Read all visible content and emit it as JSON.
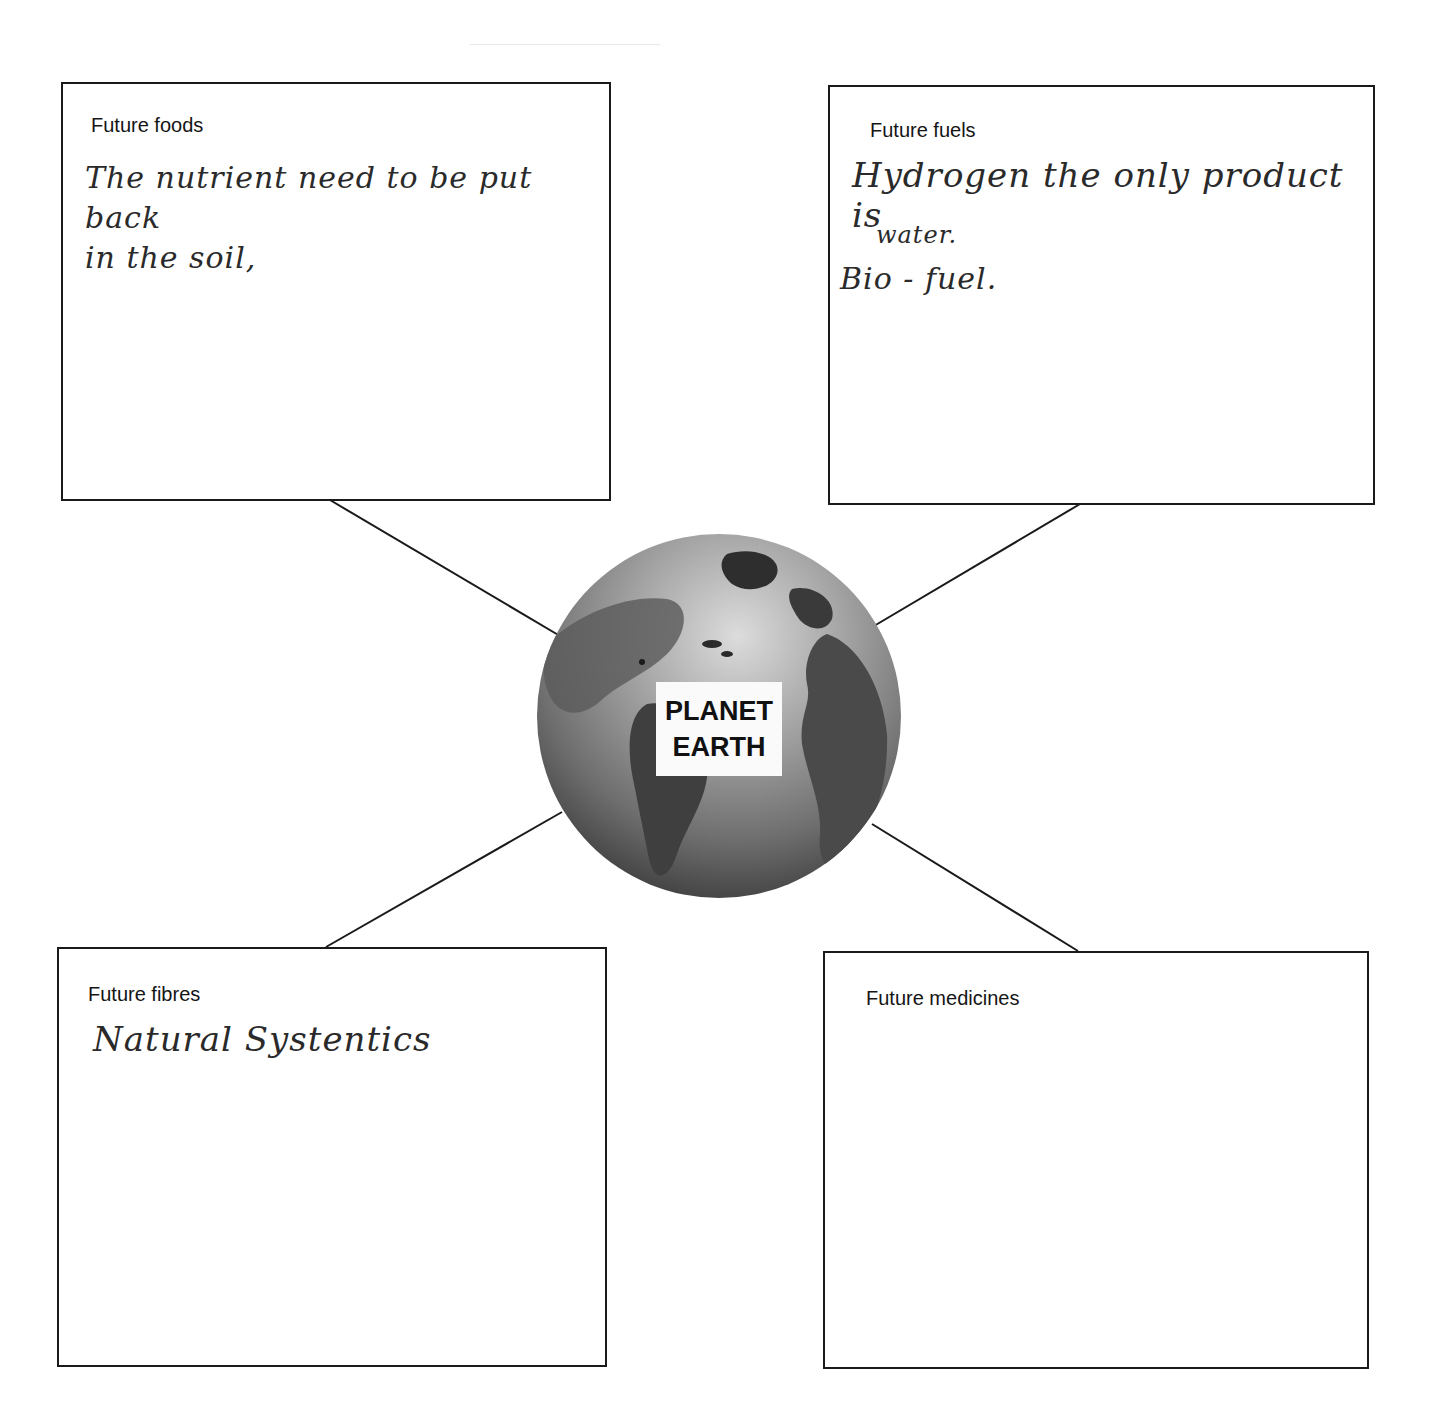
{
  "center": {
    "label_line1": "PLANET",
    "label_line2": "EARTH",
    "icon": "globe-icon"
  },
  "boxes": [
    {
      "id": "foods",
      "label": "Future foods",
      "handwriting": "The nutrient need to be put back\nin the soil,"
    },
    {
      "id": "fuels",
      "label": "Future fuels",
      "handwriting_line1": "Hydrogen the only product is",
      "handwriting_line2": "water.",
      "handwriting_line3": "Bio - fuel."
    },
    {
      "id": "fibres",
      "label": "Future fibres",
      "handwriting": "Natural Systentics"
    },
    {
      "id": "medicines",
      "label": "Future medicines",
      "handwriting": ""
    }
  ],
  "colors": {
    "border": "#1a1a1a",
    "globe_dark": "#3a3a3a",
    "globe_light": "#dcdcdc"
  }
}
